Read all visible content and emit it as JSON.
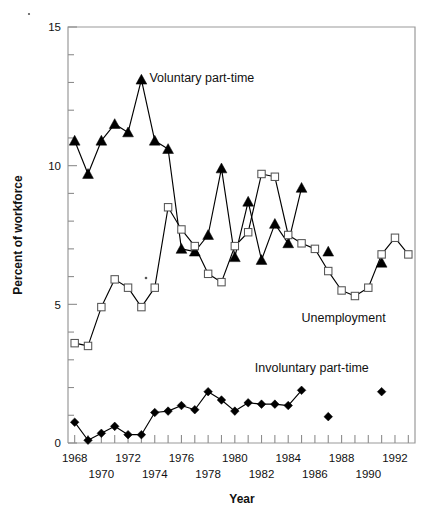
{
  "chart_data": {
    "type": "line",
    "title": "",
    "xlabel": "Year",
    "ylabel": "Percent of workforce",
    "xlim": [
      1967.5,
      1993.5
    ],
    "ylim": [
      0,
      15
    ],
    "grid": false,
    "legend_position": "inline-annotations",
    "y_ticks_major": [
      0,
      5,
      10,
      15
    ],
    "y_tick_labels": [
      "0",
      "5",
      "10",
      "15"
    ],
    "y_tick_minor_step": 1,
    "x_ticks": [
      1968,
      1969,
      1970,
      1971,
      1972,
      1973,
      1974,
      1975,
      1976,
      1977,
      1978,
      1979,
      1980,
      1981,
      1982,
      1983,
      1984,
      1985,
      1986,
      1987,
      1988,
      1989,
      1990,
      1991,
      1992,
      1993
    ],
    "x_tick_labels_row1": [
      "1968",
      "1972",
      "1976",
      "1980",
      "1984",
      "1988",
      "1992"
    ],
    "x_tick_labels_row2": [
      "1970",
      "1974",
      "1978",
      "1982",
      "1986",
      "1990"
    ],
    "series": [
      {
        "name": "Voluntary part-time",
        "marker": "filled-triangle",
        "connected": true,
        "x": [
          1968,
          1969,
          1970,
          1971,
          1972,
          1973,
          1974,
          1975,
          1976,
          1977,
          1978,
          1979,
          1980,
          1981,
          1982,
          1983,
          1984,
          1985
        ],
        "values": [
          10.9,
          9.7,
          10.9,
          11.5,
          11.2,
          13.1,
          10.9,
          10.6,
          7.0,
          6.9,
          7.5,
          9.9,
          6.7,
          8.7,
          6.6,
          7.9,
          7.2,
          9.2
        ]
      },
      {
        "name": "Voluntary part-time (isolated)",
        "marker": "filled-triangle",
        "connected": false,
        "x": [
          1987,
          1991
        ],
        "values": [
          6.9,
          6.5
        ]
      },
      {
        "name": "Unemployment",
        "marker": "open-square",
        "connected": true,
        "x": [
          1968,
          1969,
          1970,
          1971,
          1972,
          1973,
          1974,
          1975,
          1976,
          1977,
          1978,
          1979,
          1980,
          1981,
          1982,
          1983,
          1984,
          1985,
          1986,
          1987,
          1988,
          1989,
          1990,
          1991,
          1992,
          1993
        ],
        "values": [
          3.6,
          3.5,
          4.9,
          5.9,
          5.6,
          4.9,
          5.6,
          8.5,
          7.7,
          7.1,
          6.1,
          5.8,
          7.1,
          7.6,
          9.7,
          9.6,
          7.5,
          7.2,
          7.0,
          6.2,
          5.5,
          5.3,
          5.6,
          6.8,
          7.4,
          6.8
        ]
      },
      {
        "name": "Involuntary part-time",
        "marker": "filled-diamond",
        "connected": true,
        "x": [
          1968,
          1969,
          1970,
          1971,
          1972,
          1973,
          1974,
          1975,
          1976,
          1977,
          1978,
          1979,
          1980,
          1981,
          1982,
          1983,
          1984,
          1985
        ],
        "values": [
          0.75,
          0.1,
          0.35,
          0.6,
          0.3,
          0.3,
          1.1,
          1.15,
          1.35,
          1.2,
          1.85,
          1.55,
          1.15,
          1.45,
          1.4,
          1.4,
          1.35,
          1.9
        ]
      },
      {
        "name": "Involuntary part-time (isolated)",
        "marker": "filled-diamond",
        "connected": false,
        "x": [
          1987,
          1991
        ],
        "values": [
          0.95,
          1.85
        ]
      }
    ],
    "annotations": [
      {
        "text": "Voluntary part-time",
        "x": 1973.6,
        "y": 13.0
      },
      {
        "text": "Unemployment",
        "x": 1985.0,
        "y": 4.35
      },
      {
        "text": "Involuntary part-time",
        "x": 1981.5,
        "y": 2.55
      }
    ]
  },
  "axis": {
    "ylabel": "Percent of workforce",
    "xlabel": "Year"
  }
}
